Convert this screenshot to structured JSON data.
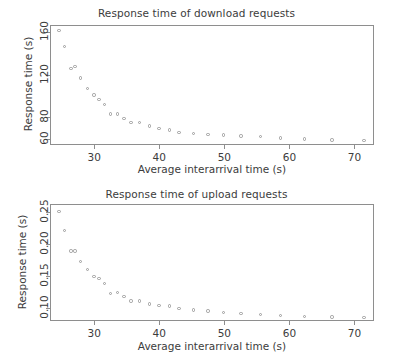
{
  "figure": {
    "background": "#ffffff",
    "point_color": "#9b9b9b",
    "axis_color": "#8e8e8e",
    "text_color": "#3c3c3c"
  },
  "chart_data": [
    {
      "type": "scatter",
      "id": "download",
      "title": "Response time of download requests",
      "xlabel": "Average interarrival time (s)",
      "ylabel": "Response time (s)",
      "xlim": [
        23.2,
        73.0
      ],
      "ylim": [
        54.0,
        167.0
      ],
      "xticks": [
        30,
        40,
        50,
        60,
        70
      ],
      "xticklabels": [
        "30",
        "40",
        "50",
        "60",
        "70"
      ],
      "yticks": [
        60,
        80,
        120,
        160
      ],
      "yticklabels": [
        "60",
        "80",
        "120",
        "160"
      ],
      "grid": false,
      "legend": null,
      "marker": "open-circle",
      "x": [
        24.4,
        25.3,
        26.3,
        26.9,
        27.7,
        28.8,
        29.8,
        30.6,
        31.4,
        32.3,
        33.4,
        34.4,
        35.5,
        36.8,
        38.3,
        39.8,
        41.4,
        42.9,
        45.1,
        47.3,
        49.7,
        52.4,
        55.4,
        58.5,
        62.2,
        66.4,
        71.3
      ],
      "y": [
        163.0,
        147.5,
        127.0,
        129.0,
        118.0,
        108.0,
        102.0,
        98.0,
        93.0,
        84.0,
        84.0,
        80.0,
        76.0,
        76.0,
        73.0,
        70.5,
        69.0,
        67.0,
        66.0,
        65.0,
        64.5,
        63.5,
        63.0,
        61.5,
        60.5,
        59.5,
        59.0
      ]
    },
    {
      "type": "scatter",
      "id": "upload",
      "title": "Response time of upload requests",
      "xlabel": "Average interarrival time (s)",
      "ylabel": "Response time (s)",
      "xlim": [
        23.2,
        73.0
      ],
      "ylim": [
        0.079,
        0.262
      ],
      "xticks": [
        30,
        40,
        50,
        60,
        70
      ],
      "xticklabels": [
        "30",
        "40",
        "50",
        "60",
        "70"
      ],
      "yticks": [
        0.1,
        0.15,
        0.2,
        0.25
      ],
      "yticklabels": [
        "0.10",
        "0.15",
        "0.20",
        "0.25"
      ],
      "grid": false,
      "legend": null,
      "marker": "open-circle",
      "x": [
        24.4,
        25.3,
        26.3,
        26.9,
        27.7,
        28.8,
        29.8,
        30.6,
        31.4,
        32.3,
        33.4,
        34.4,
        35.5,
        36.8,
        38.3,
        39.8,
        41.4,
        42.9,
        45.1,
        47.3,
        49.7,
        52.4,
        55.4,
        58.5,
        62.2,
        66.4,
        71.3
      ],
      "y": [
        0.252,
        0.222,
        0.19,
        0.19,
        0.174,
        0.161,
        0.15,
        0.147,
        0.139,
        0.124,
        0.125,
        0.119,
        0.112,
        0.112,
        0.107,
        0.105,
        0.104,
        0.1,
        0.098,
        0.096,
        0.094,
        0.092,
        0.091,
        0.089,
        0.088,
        0.087,
        0.086
      ]
    }
  ]
}
